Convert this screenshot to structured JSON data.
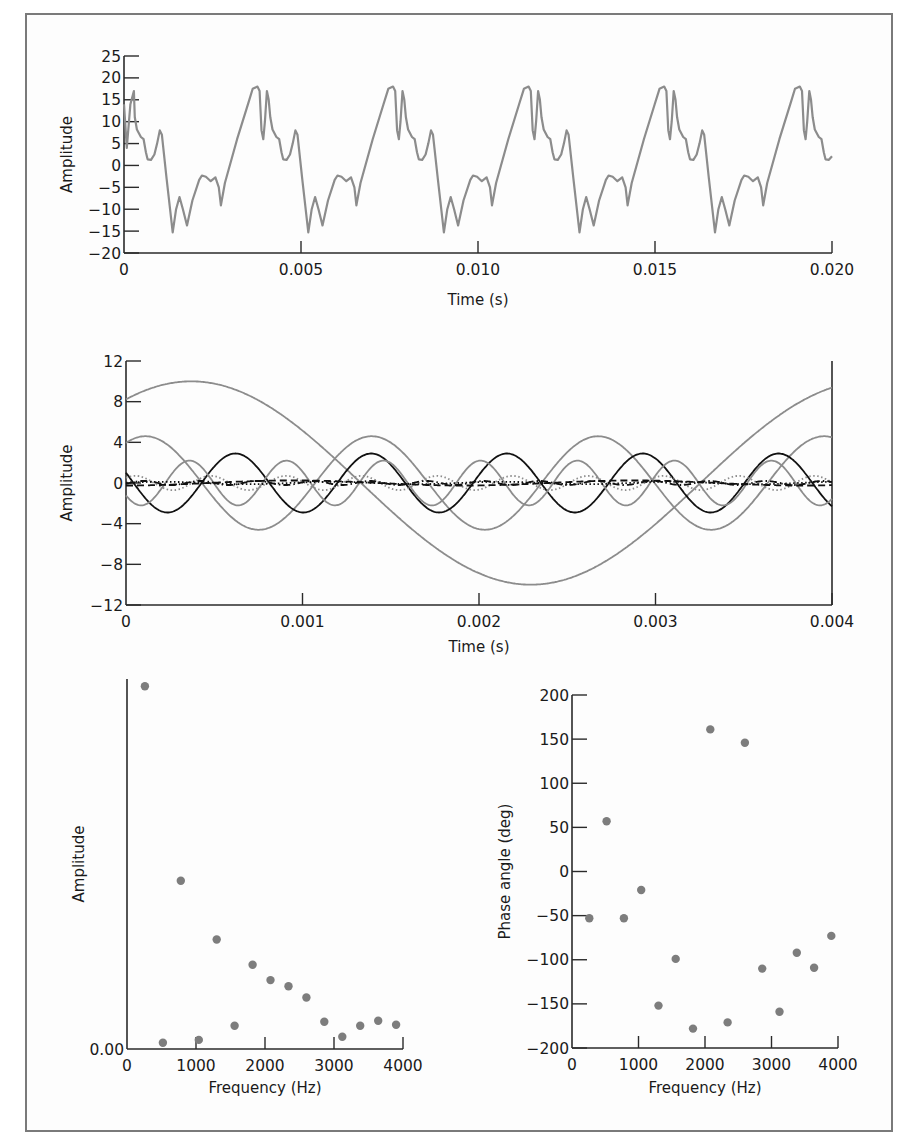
{
  "colors": {
    "axis": "#2a2a2a",
    "gray_line": "#8c8c8c",
    "black_line": "#111111",
    "marker": "#7d7d7d",
    "frame": "#7a7a7a"
  },
  "chart_data": [
    {
      "id": "waveform",
      "type": "line",
      "title": "",
      "xlabel": "Time (s)",
      "ylabel": "Amplitude",
      "xlim": [
        0,
        0.02
      ],
      "ylim": [
        -20,
        25
      ],
      "xticks": [
        0,
        0.005,
        0.01,
        0.015,
        0.02
      ],
      "xtick_labels": [
        "0",
        "0.005",
        "0.010",
        "0.015",
        "0.020"
      ],
      "yticks": [
        25,
        20,
        15,
        10,
        5,
        0,
        -5,
        -10,
        -15,
        -20
      ],
      "ytick_labels": [
        "25",
        "20",
        "15",
        "10",
        "5",
        "0",
        "−5",
        "−10",
        "−15",
        "−20"
      ],
      "grid": false,
      "series": [
        {
          "name": "complex periodic waveform",
          "color": "#8c8c8c",
          "period_s": 0.00383,
          "first_peak_t": 0.00377,
          "period_template": [
            [
              0.0,
              18.0
            ],
            [
              0.016,
              17.0
            ],
            [
              0.03,
              8.0
            ],
            [
              0.043,
              6.0
            ],
            [
              0.055,
              10.0
            ],
            [
              0.07,
              17.0
            ],
            [
              0.083,
              15.0
            ],
            [
              0.095,
              11.0
            ],
            [
              0.111,
              8.2
            ],
            [
              0.14,
              6.5
            ],
            [
              0.16,
              6.0
            ],
            [
              0.177,
              3.0
            ],
            [
              0.19,
              1.4
            ],
            [
              0.215,
              1.3
            ],
            [
              0.24,
              2.5
            ],
            [
              0.26,
              5.0
            ],
            [
              0.28,
              8.0
            ],
            [
              0.295,
              7.0
            ],
            [
              0.33,
              -3.0
            ],
            [
              0.375,
              -15.3
            ],
            [
              0.4,
              -10.0
            ],
            [
              0.425,
              -7.2
            ],
            [
              0.45,
              -10.0
            ],
            [
              0.48,
              -13.7
            ],
            [
              0.52,
              -8.0
            ],
            [
              0.57,
              -3.3
            ],
            [
              0.59,
              -2.3
            ],
            [
              0.62,
              -2.6
            ],
            [
              0.655,
              -3.6
            ],
            [
              0.69,
              -2.7
            ],
            [
              0.715,
              -5.0
            ],
            [
              0.73,
              -9.1
            ],
            [
              0.76,
              -4.0
            ],
            [
              0.85,
              6.0
            ],
            [
              0.93,
              14.0
            ],
            [
              0.965,
              17.5
            ],
            [
              1.0,
              18.0
            ]
          ],
          "start_values": [
            [
              0.0,
              14.0
            ],
            [
              8e-05,
              4.0
            ],
            [
              0.00018,
              14.0
            ],
            [
              0.00028,
              17.0
            ]
          ],
          "end_value": 2.1
        }
      ]
    },
    {
      "id": "components",
      "type": "line",
      "title": "",
      "xlabel": "Time (s)",
      "ylabel": "Amplitude",
      "xlim": [
        0,
        0.004
      ],
      "ylim": [
        -12,
        12
      ],
      "xticks": [
        0,
        0.001,
        0.002,
        0.003,
        0.004
      ],
      "xtick_labels": [
        "0",
        "0.001",
        "0.002",
        "0.003",
        "0.004"
      ],
      "yticks": [
        12,
        8,
        4,
        0,
        -4,
        -8,
        -12
      ],
      "ytick_labels": [
        "12",
        "8",
        "4",
        "0",
        "−4",
        "−8",
        "−12"
      ],
      "grid": false,
      "series": [
        {
          "name": "260 Hz component",
          "freq_hz": 260,
          "amplitude": 10.0,
          "peak_t": 0.00037,
          "color": "#8c8c8c",
          "style": "solid"
        },
        {
          "name": "780 Hz component",
          "freq_hz": 780,
          "amplitude": 4.6,
          "peak_t": 0.00011,
          "color": "#8c8c8c",
          "style": "solid"
        },
        {
          "name": "1300 Hz component",
          "freq_hz": 1300,
          "amplitude": 2.9,
          "peak_t": 0.00062,
          "color": "#111111",
          "style": "solid"
        },
        {
          "name": "1820 Hz component",
          "freq_hz": 1820,
          "amplitude": 2.2,
          "peak_t": 0.00036,
          "color": "#8c8c8c",
          "style": "solid"
        },
        {
          "name": "2340 Hz component",
          "freq_hz": 2340,
          "amplitude": 0.7,
          "peak_t": 0.00048,
          "color": "#8c8c8c",
          "style": "dotted"
        },
        {
          "name": "520 Hz component",
          "freq_hz": 520,
          "amplitude": 0.25,
          "peak_t": 0.00095,
          "color": "#111111",
          "style": "dashed"
        },
        {
          "name": "1040 Hz component",
          "freq_hz": 1040,
          "amplitude": 0.12,
          "peak_t": 0.0002,
          "color": "#111111",
          "style": "dotted"
        },
        {
          "name": "3120 Hz component",
          "freq_hz": 3120,
          "amplitude": 0.2,
          "peak_t": 0.0001,
          "color": "#111111",
          "style": "dashdot"
        }
      ]
    },
    {
      "id": "amplitude_spectrum",
      "type": "scatter",
      "title": "",
      "xlabel": "Frequency (Hz)",
      "ylabel": "Amplitude",
      "xlim": [
        0,
        4000
      ],
      "ylim": [
        0,
        10.2
      ],
      "xticks": [
        0,
        1000,
        2000,
        3000,
        4000
      ],
      "xtick_labels": [
        "0",
        "1000",
        "2000",
        "3000",
        "4000"
      ],
      "yticks": [
        0
      ],
      "ytick_labels": [
        "0.00"
      ],
      "grid": false,
      "x": [
        260,
        520,
        780,
        1040,
        1300,
        1560,
        1820,
        2080,
        2340,
        2600,
        2860,
        3120,
        3380,
        3640,
        3900
      ],
      "values": [
        10.0,
        0.17,
        4.64,
        0.25,
        3.02,
        0.64,
        2.32,
        1.9,
        1.73,
        1.42,
        0.75,
        0.34,
        0.64,
        0.78,
        0.67
      ]
    },
    {
      "id": "phase_spectrum",
      "type": "scatter",
      "title": "",
      "xlabel": "Frequency (Hz)",
      "ylabel": "Phase angle (deg)",
      "xlim": [
        0,
        4000
      ],
      "ylim": [
        -200,
        200
      ],
      "xticks": [
        0,
        1000,
        2000,
        3000,
        4000
      ],
      "xtick_labels": [
        "0",
        "1000",
        "2000",
        "3000",
        "4000"
      ],
      "yticks": [
        200,
        150,
        100,
        50,
        0,
        -50,
        -100,
        -150,
        -200
      ],
      "ytick_labels": [
        "200",
        "150",
        "100",
        "50",
        "0",
        "−50",
        "−100",
        "−150",
        "−200"
      ],
      "grid": false,
      "x": [
        260,
        520,
        780,
        1040,
        1300,
        1560,
        1820,
        2080,
        2340,
        2600,
        2860,
        3120,
        3380,
        3640,
        3900
      ],
      "values": [
        -53,
        57,
        -53,
        -21,
        -152,
        -99,
        -178,
        161,
        -171,
        146,
        -110,
        -159,
        -92,
        -109,
        -73
      ]
    }
  ],
  "layout": {
    "waveform": {
      "x0": 124,
      "x1": 832,
      "y_top": 56,
      "y_bottom": 253,
      "axis_label_x": 72,
      "xlabel_y": 305,
      "right_axis": false
    },
    "components": {
      "x0": 126,
      "x1": 832,
      "y_top": 361,
      "y_bottom": 605,
      "axis_label_x": 72,
      "xlabel_y": 652,
      "right_axis": true
    },
    "amplitude_spectrum": {
      "x0": 127,
      "x1": 403,
      "y_top": 679,
      "y_bottom": 1049,
      "axis_label_x": 84,
      "xlabel_y": 1093,
      "right_axis": false
    },
    "phase_spectrum": {
      "x0": 572,
      "x1": 838,
      "y_top": 695,
      "y_bottom": 1048,
      "axis_label_x": 510,
      "xlabel_y": 1093,
      "right_axis": false
    }
  }
}
